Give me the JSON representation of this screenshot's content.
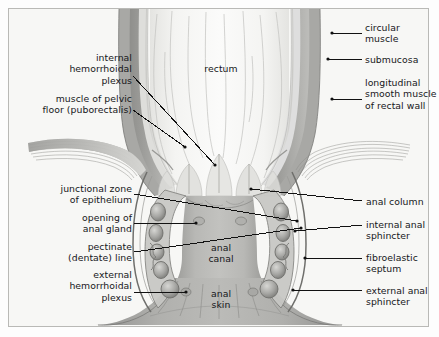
{
  "figure": {
    "background_color": "#f7f7f5",
    "border_color": "#b9b9b6",
    "ink_color": "#16161a",
    "leader_color": "#111111"
  },
  "labels_left": [
    {
      "id": "internal-hemorrhoidal-plexus",
      "text": "internal\nhemorrhoidal\nplexus",
      "x": 48,
      "y": 52,
      "width": 84,
      "leader": [
        [
          133,
          76
        ],
        [
          215,
          165
        ]
      ]
    },
    {
      "id": "muscle-of-pelvic-floor",
      "text": "muscle of pelvic\nfloor (puborectalis)",
      "x": 14,
      "y": 93,
      "width": 118,
      "leader": [
        [
          133,
          110
        ],
        [
          185,
          147
        ]
      ]
    },
    {
      "id": "junctional-zone-of-epithelium",
      "text": "junctional zone\nof epithelium",
      "x": 22,
      "y": 183,
      "width": 110,
      "leader": [
        [
          134,
          194
        ],
        [
          297,
          221
        ]
      ]
    },
    {
      "id": "opening-of-anal-gland",
      "text": "opening of\nanal gland",
      "x": 40,
      "y": 212,
      "width": 92,
      "leader": [
        [
          134,
          223
        ],
        [
          196,
          223
        ]
      ]
    },
    {
      "id": "pectinate-dentate-line",
      "text": "pectinate\n(dentate) line",
      "x": 32,
      "y": 241,
      "width": 100,
      "leader": [
        [
          134,
          252
        ],
        [
          301,
          228
        ]
      ]
    },
    {
      "id": "external-hemorrhoidal-plexus",
      "text": "external\nhemorrhoidal\nplexus",
      "x": 46,
      "y": 269,
      "width": 86,
      "leader": [
        [
          134,
          292
        ],
        [
          186,
          292
        ]
      ]
    }
  ],
  "labels_right": [
    {
      "id": "circular-muscle",
      "text": "circular\nmuscle",
      "x": 365,
      "y": 22,
      "width": 70,
      "leader": [
        [
          362,
          33
        ],
        [
          332,
          33
        ]
      ]
    },
    {
      "id": "submucosa",
      "text": "submucosa",
      "x": 365,
      "y": 54,
      "width": 70,
      "leader": [
        [
          362,
          59
        ],
        [
          328,
          59
        ]
      ]
    },
    {
      "id": "longitudinal-smooth-muscle-of-rectal-wall",
      "text": "longitudinal\nsmooth muscle\nof rectal wall",
      "x": 365,
      "y": 77,
      "width": 74,
      "leader": [
        [
          362,
          99
        ],
        [
          332,
          99
        ]
      ]
    },
    {
      "id": "anal-column",
      "text": "anal column",
      "x": 366,
      "y": 196,
      "width": 73,
      "leader": [
        [
          362,
          201
        ],
        [
          251,
          189
        ]
      ]
    },
    {
      "id": "internal-anal-sphincter",
      "text": "internal anal\nsphincter",
      "x": 366,
      "y": 219,
      "width": 73,
      "leader": [
        [
          362,
          225
        ],
        [
          295,
          231
        ]
      ]
    },
    {
      "id": "fibroelastic-septum",
      "text": "fibroelastic\nseptum",
      "x": 366,
      "y": 252,
      "width": 73,
      "leader": [
        [
          362,
          258
        ],
        [
          305,
          258
        ]
      ]
    },
    {
      "id": "external-anal-sphincter",
      "text": "external anal\nsphincter",
      "x": 366,
      "y": 285,
      "width": 73,
      "leader": [
        [
          362,
          290
        ],
        [
          293,
          290
        ]
      ]
    }
  ],
  "labels_center": [
    {
      "id": "rectum",
      "text": "rectum",
      "x": 190,
      "y": 63,
      "width": 62
    },
    {
      "id": "anal-canal",
      "text": "anal\ncanal",
      "x": 198,
      "y": 242,
      "width": 46
    },
    {
      "id": "anal-skin",
      "text": "anal\nskin",
      "x": 198,
      "y": 288,
      "width": 46
    }
  ],
  "palette": {
    "rectal_lumen": "#f3f3f1",
    "rectal_wall_light": "#e8e8e6",
    "mucosa_fold": "#cfcfcc",
    "circular_muscle": "#a9a9a6",
    "submucosa": "#dededb",
    "longitudinal_muscle": "#8e8e8b",
    "internal_sphincter": "#bdbdba",
    "external_sphincter": "#9a9a97",
    "anal_canal_fill": "#b4b4b1",
    "anal_skin": "#a3a3a0",
    "puborectalis": "#bcbcb9",
    "outline": "#6f6f6c"
  }
}
